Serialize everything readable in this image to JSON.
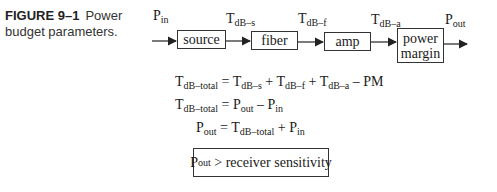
{
  "caption": {
    "figure_number": "FIGURE 9–1",
    "text": "Power budget parameters."
  },
  "blocks": [
    {
      "id": "source",
      "label": "source"
    },
    {
      "id": "fiber",
      "label": "fiber"
    },
    {
      "id": "amp",
      "label": "amp"
    },
    {
      "id": "power_margin",
      "label_line1": "power",
      "label_line2": "margin"
    }
  ],
  "signals": {
    "p_in": {
      "base": "P",
      "sub": "in"
    },
    "t_s": {
      "base": "T",
      "sub": "dB–s"
    },
    "t_f": {
      "base": "T",
      "sub": "dB–f"
    },
    "t_a": {
      "base": "T",
      "sub": "dB–a"
    },
    "p_out": {
      "base": "P",
      "sub": "out"
    }
  },
  "equations": [
    {
      "parts": [
        "T",
        "dB–total",
        " = T",
        "dB–s",
        " + T",
        "dB–f",
        " + T",
        "dB–a",
        " – PM"
      ]
    },
    {
      "parts": [
        "T",
        "dB–total",
        " = P",
        "out",
        " – P",
        "in"
      ]
    },
    {
      "parts": [
        "P",
        "out",
        " = T",
        "dB–total",
        " + P",
        "in"
      ]
    }
  ],
  "condition": {
    "base": "P",
    "sub": "out",
    "text": " > receiver sensitivity"
  }
}
